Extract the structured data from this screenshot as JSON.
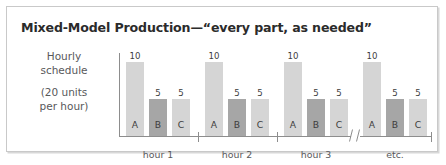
{
  "title": "Mixed-Model Production—“every part, as needed”",
  "caption": {
    "line1": "Hourly",
    "line2": "schedule",
    "line3": "(20 units",
    "line4": "per hour)"
  },
  "colors": {
    "bar_light": "#d5d5d5",
    "bar_dark": "#a6a6a6",
    "axis": "#8d8d8d",
    "text": "#3d3d3d",
    "title": "#2b2b2b",
    "frame": "#c9c9c9"
  },
  "chart_data": {
    "type": "bar",
    "title": "Mixed-Model Production—“every part, as needed”",
    "xlabel": "",
    "ylabel": "Hourly schedule (20 units per hour)",
    "ylim": [
      0,
      10
    ],
    "grid": false,
    "legend": "none",
    "axis_break": true,
    "categories": [
      "hour 1",
      "hour 2",
      "hour 3",
      "etc."
    ],
    "parts": [
      "A",
      "B",
      "C"
    ],
    "series": [
      {
        "name": "A",
        "values": [
          10,
          10,
          10,
          10
        ],
        "shade": "light"
      },
      {
        "name": "B",
        "values": [
          5,
          5,
          5,
          5
        ],
        "shade": "dark"
      },
      {
        "name": "C",
        "values": [
          5,
          5,
          5,
          5
        ],
        "shade": "light"
      }
    ],
    "groups": [
      {
        "label": "hour 1",
        "bars": [
          {
            "letter": "A",
            "value": "10",
            "height": 10,
            "shade": "light"
          },
          {
            "letter": "B",
            "value": "5",
            "height": 5,
            "shade": "dark"
          },
          {
            "letter": "C",
            "value": "5",
            "height": 5,
            "shade": "light"
          }
        ]
      },
      {
        "label": "hour 2",
        "bars": [
          {
            "letter": "A",
            "value": "10",
            "height": 10,
            "shade": "light"
          },
          {
            "letter": "B",
            "value": "5",
            "height": 5,
            "shade": "dark"
          },
          {
            "letter": "C",
            "value": "5",
            "height": 5,
            "shade": "light"
          }
        ]
      },
      {
        "label": "hour 3",
        "bars": [
          {
            "letter": "A",
            "value": "10",
            "height": 10,
            "shade": "light"
          },
          {
            "letter": "B",
            "value": "5",
            "height": 5,
            "shade": "dark"
          },
          {
            "letter": "C",
            "value": "5",
            "height": 5,
            "shade": "light"
          }
        ]
      },
      {
        "label": "etc.",
        "bars": [
          {
            "letter": "A",
            "value": "10",
            "height": 10,
            "shade": "light"
          },
          {
            "letter": "B",
            "value": "5",
            "height": 5,
            "shade": "dark"
          },
          {
            "letter": "C",
            "value": "5",
            "height": 5,
            "shade": "light"
          }
        ]
      }
    ]
  }
}
